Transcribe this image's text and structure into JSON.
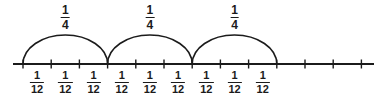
{
  "figure": {
    "type": "number-line-diagram",
    "width": 387,
    "height": 99,
    "background_color": "#ffffff",
    "stroke_color": "#1b1b1b",
    "text_color": "#1b1b1b"
  },
  "numberline": {
    "axis_y": 64,
    "x_start": 13,
    "x_end": 374,
    "tick_start_x": 23,
    "tick_spacing": 28.2,
    "tick_count": 13,
    "tick_height": 9,
    "ticks_x": [
      23,
      51.2,
      79.4,
      107.6,
      135.8,
      164.0,
      192.2,
      220.4,
      248.6,
      276.8,
      305.0,
      333.2,
      361.4
    ]
  },
  "arcs": [
    {
      "label_numerator": "1",
      "label_denominator": "4",
      "start_x": 23,
      "end_x": 107.6,
      "peak_y": 35,
      "label_x": 65.3,
      "label_y": 4
    },
    {
      "label_numerator": "1",
      "label_denominator": "4",
      "start_x": 107.6,
      "end_x": 192.2,
      "peak_y": 35,
      "label_x": 149.9,
      "label_y": 4
    },
    {
      "label_numerator": "1",
      "label_denominator": "4",
      "start_x": 192.2,
      "end_x": 276.8,
      "peak_y": 35,
      "label_x": 234.5,
      "label_y": 4
    }
  ],
  "interval_labels": [
    {
      "numerator": "1",
      "denominator": "12",
      "x": 37.1,
      "y": 70
    },
    {
      "numerator": "1",
      "denominator": "12",
      "x": 65.3,
      "y": 70
    },
    {
      "numerator": "1",
      "denominator": "12",
      "x": 93.5,
      "y": 70
    },
    {
      "numerator": "1",
      "denominator": "12",
      "x": 121.7,
      "y": 70
    },
    {
      "numerator": "1",
      "denominator": "12",
      "x": 149.9,
      "y": 70
    },
    {
      "numerator": "1",
      "denominator": "12",
      "x": 178.1,
      "y": 70
    },
    {
      "numerator": "1",
      "denominator": "12",
      "x": 206.3,
      "y": 70
    },
    {
      "numerator": "1",
      "denominator": "12",
      "x": 234.5,
      "y": 70
    },
    {
      "numerator": "1",
      "denominator": "12",
      "x": 262.7,
      "y": 70
    }
  ]
}
